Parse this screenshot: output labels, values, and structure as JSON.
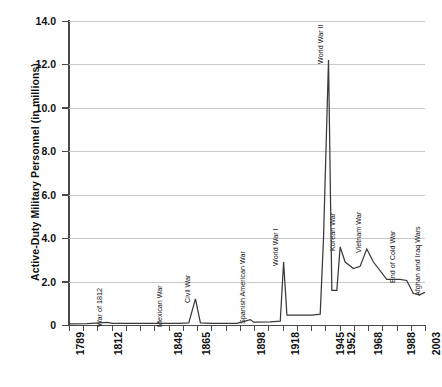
{
  "chart_data": {
    "type": "line",
    "title": "",
    "xlabel": "",
    "ylabel": "Active-Duty Military Personnel (in millions)",
    "ylim": [
      0,
      14
    ],
    "grid": true,
    "legend": "none",
    "y_ticks": [
      "0",
      "2.0",
      "4.0",
      "6.0",
      "8.0",
      "10.0",
      "12.0",
      "14.0"
    ],
    "y_tick_values": [
      0,
      2,
      4,
      6,
      8,
      10,
      12,
      14
    ],
    "x_tick_labels": [
      "1789",
      "1812",
      "1848",
      "1865",
      "1898",
      "1918",
      "1945",
      "1952",
      "1968",
      "1988",
      "2003"
    ],
    "x_tick_years": [
      1789,
      1812,
      1848,
      1865,
      1898,
      1918,
      1945,
      1952,
      1968,
      1988,
      2003
    ],
    "xlim": [
      1789,
      2003
    ],
    "annotations": [
      {
        "label": "War of 1812",
        "year": 1812,
        "value": 0.1
      },
      {
        "label": "Mexican War",
        "year": 1848,
        "value": 0.1
      },
      {
        "label": "Civil War",
        "year": 1865,
        "value": 1.2
      },
      {
        "label": "Spanish American War",
        "year": 1898,
        "value": 0.25
      },
      {
        "label": "World War I",
        "year": 1918,
        "value": 2.9
      },
      {
        "label": "World War II",
        "year": 1945,
        "value": 12.2
      },
      {
        "label": "Korean War",
        "year": 1952,
        "value": 3.6
      },
      {
        "label": "Vietnam War",
        "year": 1968,
        "value": 3.5
      },
      {
        "label": "End of Cold War",
        "year": 1988,
        "value": 2.1
      },
      {
        "label": "Afghan and Iraq Wars",
        "year": 2003,
        "value": 1.5
      }
    ],
    "series": [
      {
        "name": "Active-Duty Military Personnel",
        "color": "#3a3a3a",
        "x": [
          1789,
          1800,
          1812,
          1815,
          1825,
          1835,
          1848,
          1850,
          1855,
          1861,
          1865,
          1868,
          1875,
          1890,
          1898,
          1900,
          1910,
          1916,
          1918,
          1920,
          1925,
          1935,
          1940,
          1942,
          1945,
          1947,
          1950,
          1952,
          1955,
          1960,
          1964,
          1968,
          1972,
          1980,
          1988,
          1992,
          1996,
          2000,
          2003
        ],
        "values": [
          0.05,
          0.06,
          0.12,
          0.08,
          0.07,
          0.07,
          0.08,
          0.07,
          0.07,
          0.1,
          1.2,
          0.1,
          0.07,
          0.08,
          0.25,
          0.13,
          0.14,
          0.18,
          2.9,
          0.45,
          0.45,
          0.45,
          0.5,
          4.0,
          12.2,
          1.6,
          1.6,
          3.6,
          2.9,
          2.6,
          2.7,
          3.5,
          2.9,
          2.1,
          2.1,
          2.05,
          1.45,
          1.4,
          1.5
        ]
      }
    ]
  },
  "axis": {
    "y_label_text": "Active-Duty Military Personnel (in millions)"
  }
}
